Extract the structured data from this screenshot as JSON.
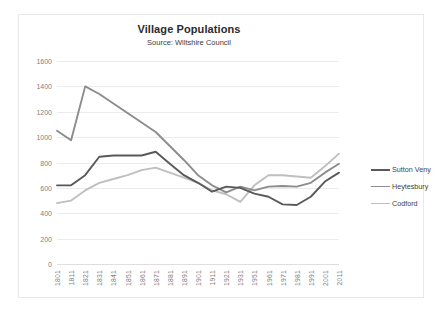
{
  "chart_data": {
    "type": "line",
    "title": "Village Populations",
    "subtitle": "Source: Wiltshire Council",
    "xlabel": "",
    "ylabel": "",
    "ylim": [
      0,
      1600
    ],
    "ytick_step": 200,
    "grid": true,
    "legend_position": "right",
    "categories": [
      "1801",
      "1811",
      "1821",
      "1831",
      "1841",
      "1851",
      "1861",
      "1871",
      "1881",
      "1891",
      "1901",
      "1911",
      "1921",
      "1931",
      "1951",
      "1961",
      "1971",
      "1981",
      "1991",
      "2001",
      "2011"
    ],
    "yticks": [
      0,
      200,
      400,
      600,
      800,
      1000,
      1200,
      1400,
      1600
    ],
    "series": [
      {
        "name": "Sutton Veny",
        "color": "#595959",
        "values": [
          620,
          620,
          700,
          845,
          855,
          855,
          855,
          885,
          790,
          700,
          640,
          570,
          610,
          600,
          555,
          530,
          470,
          465,
          530,
          650,
          720
        ]
      },
      {
        "name": "Heytesbury",
        "color": "#8c8c8c",
        "values": [
          1050,
          975,
          1400,
          1340,
          1265,
          1190,
          1115,
          1040,
          930,
          820,
          700,
          620,
          565,
          610,
          580,
          610,
          615,
          610,
          640,
          720,
          790
        ]
      },
      {
        "name": "Codford",
        "color": "#bfbfbf",
        "values": [
          480,
          500,
          580,
          640,
          670,
          700,
          740,
          760,
          720,
          680,
          640,
          580,
          550,
          490,
          620,
          700,
          700,
          690,
          680,
          770,
          870
        ]
      }
    ]
  },
  "legend": {
    "items": [
      {
        "label": "Sutton Veny",
        "color": "#595959"
      },
      {
        "label": "Heytesbury",
        "color": "#8c8c8c"
      },
      {
        "label": "Codford",
        "color": "#bfbfbf"
      }
    ]
  }
}
